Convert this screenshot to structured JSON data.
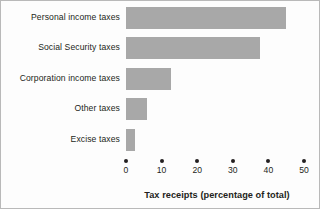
{
  "chart_data": {
    "type": "bar",
    "orientation": "horizontal",
    "title": "",
    "subtitle": "",
    "xlabel": "Tax receipts (percentage of total)",
    "ylabel": "",
    "xlim": [
      0,
      50
    ],
    "xticks": [
      0,
      10,
      20,
      30,
      40,
      50
    ],
    "xtick_labels": [
      "0",
      "10",
      "20",
      "30",
      "40",
      "50"
    ],
    "grid": false,
    "legend": false,
    "legend_position": "none",
    "bar_color": "#a8a8a8",
    "axis_color": "#231f20",
    "categories": [
      "Personal income taxes",
      "Social Security taxes",
      "Corporation income taxes",
      "Other taxes",
      "Excise taxes"
    ],
    "values": [
      45,
      37.5,
      12.5,
      6,
      2.5
    ]
  },
  "axis": {
    "title": "Tax receipts (percentage of total)"
  }
}
